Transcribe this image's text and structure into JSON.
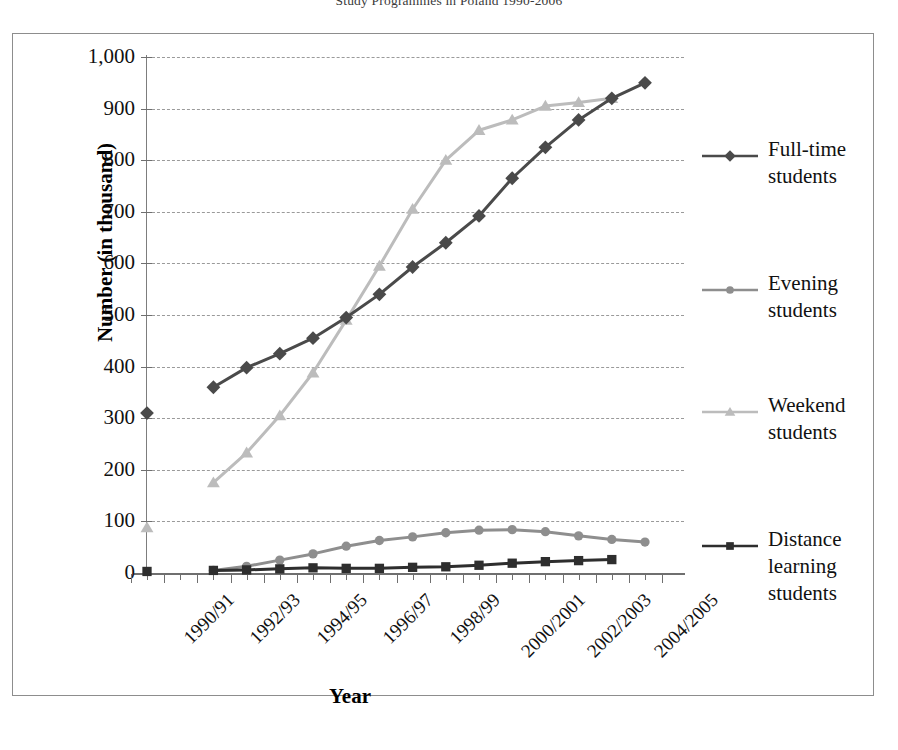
{
  "chart_data": {
    "type": "line",
    "title": "Study Programmes in Poland 1990-2006",
    "xlabel": "Year",
    "ylabel": "Number (in thousand)",
    "ylim": [
      0,
      1000
    ],
    "y_ticks": [
      "0",
      "100",
      "200",
      "300",
      "400",
      "500",
      "600",
      "700",
      "800",
      "900",
      "1,000"
    ],
    "grid": true,
    "legend_position": "right",
    "categories": [
      "1990/91",
      "1991/92",
      "1992/93",
      "1993/94",
      "1994/95",
      "1995/96",
      "1996/97",
      "1997/98",
      "1998/99",
      "1999/2000",
      "2000/2001",
      "2001/2002",
      "2002/2003",
      "2003/2004",
      "2004/2005",
      "2005/2006"
    ],
    "x_tick_labels": [
      "1990/91",
      "1992/93",
      "1994/95",
      "1996/97",
      "1998/99",
      "2000/2001",
      "2002/2003",
      "2004/2005"
    ],
    "series": [
      {
        "name": "Full-time students",
        "color": "#4a4a4a",
        "marker": "diamond",
        "values": [
          310,
          null,
          360,
          398,
          425,
          455,
          495,
          540,
          593,
          640,
          692,
          765,
          825,
          878,
          920,
          950
        ]
      },
      {
        "name": "Evening students",
        "color": "#8e8e8e",
        "marker": "circle",
        "values": [
          null,
          null,
          5,
          13,
          25,
          37,
          52,
          63,
          70,
          78,
          83,
          84,
          80,
          72,
          65,
          60
        ]
      },
      {
        "name": "Weekend students",
        "color": "#bcbcbc",
        "marker": "triangle",
        "values": [
          88,
          null,
          175,
          233,
          305,
          388,
          490,
          595,
          705,
          800,
          858,
          878,
          905,
          912,
          920,
          null
        ]
      },
      {
        "name": "Distance learning students",
        "color": "#2e2e2e",
        "marker": "square",
        "values": [
          3,
          null,
          5,
          6,
          8,
          10,
          9,
          9,
          11,
          12,
          15,
          19,
          22,
          24,
          26,
          null
        ]
      }
    ]
  },
  "legend": {
    "items": [
      {
        "label_line1": "Full-time",
        "label_line2": "students",
        "color": "#4a4a4a",
        "marker": "diamond"
      },
      {
        "label_line1": "Evening",
        "label_line2": "students",
        "color": "#8e8e8e",
        "marker": "circle"
      },
      {
        "label_line1": "Weekend",
        "label_line2": "students",
        "color": "#bcbcbc",
        "marker": "triangle"
      },
      {
        "label_line1": "Distance",
        "label_line2": "learning",
        "label_line3": "students",
        "color": "#2e2e2e",
        "marker": "square"
      }
    ]
  }
}
